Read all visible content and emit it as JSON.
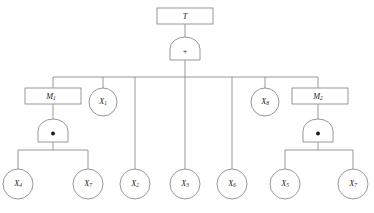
{
  "figure": {
    "type": "fault-tree",
    "background_color": "#ffffff",
    "line_color": "#8c8c8c",
    "text_color": "#1a1a1a"
  },
  "nodes": {
    "top_event": {
      "id": "T",
      "label": "T",
      "base": "T",
      "sub": "",
      "shape": "rectangle"
    },
    "intermediate": [
      {
        "id": "M1",
        "label": "M1",
        "base": "M",
        "sub": "1",
        "shape": "rectangle"
      },
      {
        "id": "M2",
        "label": "M2",
        "base": "M",
        "sub": "2",
        "shape": "rectangle"
      }
    ],
    "basic_events": [
      {
        "id": "X1",
        "label": "X1",
        "base": "X",
        "sub": "1",
        "shape": "circle"
      },
      {
        "id": "X2",
        "label": "X2",
        "base": "X",
        "sub": "2",
        "shape": "circle"
      },
      {
        "id": "X3",
        "label": "X3",
        "base": "X",
        "sub": "3",
        "shape": "circle"
      },
      {
        "id": "X4",
        "label": "X4",
        "base": "X",
        "sub": "4",
        "shape": "circle"
      },
      {
        "id": "X5",
        "label": "X5",
        "base": "X",
        "sub": "5",
        "shape": "circle"
      },
      {
        "id": "X6",
        "label": "X6",
        "base": "X",
        "sub": "6",
        "shape": "circle"
      },
      {
        "id": "X7a",
        "label": "X7",
        "base": "X",
        "sub": "7",
        "shape": "circle"
      },
      {
        "id": "X7b",
        "label": "X7",
        "base": "X",
        "sub": "7",
        "shape": "circle"
      },
      {
        "id": "X8",
        "label": "X8",
        "base": "X",
        "sub": "8",
        "shape": "circle"
      }
    ]
  },
  "gates": [
    {
      "id": "G0",
      "symbol": "+",
      "kind": "or-gate",
      "parent": "T"
    },
    {
      "id": "G1",
      "symbol": "●",
      "kind": "and-gate",
      "parent": "M1"
    },
    {
      "id": "G2",
      "symbol": "●",
      "kind": "and-gate",
      "parent": "M2"
    }
  ],
  "edges": [
    {
      "from": "T",
      "to": "G0"
    },
    {
      "from": "G0",
      "to": "M1"
    },
    {
      "from": "G0",
      "to": "X1"
    },
    {
      "from": "G0",
      "to": "X2"
    },
    {
      "from": "G0",
      "to": "X3"
    },
    {
      "from": "G0",
      "to": "X6"
    },
    {
      "from": "G0",
      "to": "X8"
    },
    {
      "from": "G0",
      "to": "M2"
    },
    {
      "from": "M1",
      "to": "G1"
    },
    {
      "from": "G1",
      "to": "X4"
    },
    {
      "from": "G1",
      "to": "X7a"
    },
    {
      "from": "M2",
      "to": "G2"
    },
    {
      "from": "G2",
      "to": "X5"
    },
    {
      "from": "G2",
      "to": "X7b"
    }
  ]
}
